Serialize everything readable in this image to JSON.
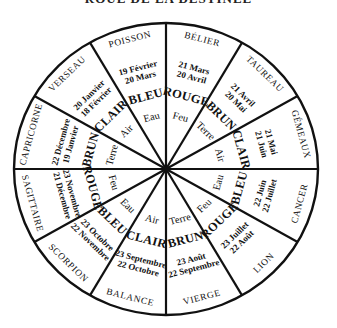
{
  "title": "ROUE DE LA DESTINÉE",
  "wheel": {
    "center": [
      166,
      169
    ],
    "rx": 152,
    "ry": 146,
    "line_color": "#111111",
    "sectors": [
      {
        "sign": "BÉLIER",
        "date1": "21 Mars",
        "date2": "20 Avril",
        "color": "ROUGE",
        "element": "Feu",
        "mid_angle": 15
      },
      {
        "sign": "TAUREAU",
        "date1": "21 Avril",
        "date2": "20 Mai",
        "color": "BRUN",
        "element": "Terre",
        "mid_angle": 45
      },
      {
        "sign": "GÉMEAUX",
        "date1": "21 Mai",
        "date2": "21 Juin",
        "color": "CLAIR",
        "element": "Air",
        "mid_angle": 75
      },
      {
        "sign": "CANCER",
        "date1": "22 Juin",
        "date2": "22 Juillet",
        "color": "BLEU",
        "element": "Eau",
        "mid_angle": 105
      },
      {
        "sign": "LION",
        "date1": "23 Juillet",
        "date2": "22 Août",
        "color": "ROUGE",
        "element": "Feu",
        "mid_angle": 135
      },
      {
        "sign": "VIERGE",
        "date1": "23 Août",
        "date2": "22 Septembre",
        "color": "BRUN",
        "element": "Terre",
        "mid_angle": 165
      },
      {
        "sign": "BALANCE",
        "date1": "23 Septembre",
        "date2": "22 Octobre",
        "color": "CLAIR",
        "element": "Air",
        "mid_angle": 195
      },
      {
        "sign": "SCORPION",
        "date1": "23 Octobre",
        "date2": "22 Novembre",
        "color": "BLEU",
        "element": "Eau",
        "mid_angle": 225
      },
      {
        "sign": "SAGITTAIRE",
        "date1": "23 Novembre",
        "date2": "21 Décembre",
        "color": "ROUGE",
        "element": "Feu",
        "mid_angle": 255
      },
      {
        "sign": "CAPRICORNE",
        "date1": "22 Décembre",
        "date2": "19 Janvier",
        "color": "BRUN",
        "element": "Terre",
        "mid_angle": 285
      },
      {
        "sign": "VERSEAU",
        "date1": "20 Janvier",
        "date2": "18 Février",
        "color": "CLAIR",
        "element": "Air",
        "mid_angle": 315
      },
      {
        "sign": "POISSON",
        "date1": "19 Février",
        "date2": "20 Mars",
        "color": "BLEU",
        "element": "Eau",
        "mid_angle": 345
      }
    ]
  }
}
